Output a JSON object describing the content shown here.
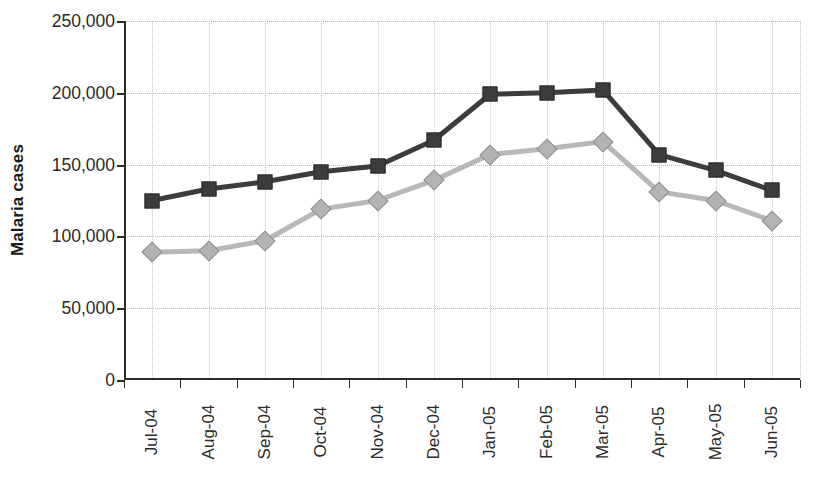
{
  "chart_data": {
    "type": "line",
    "title": "",
    "xlabel": "",
    "ylabel": "Malaria cases",
    "categories": [
      "Jul-04",
      "Aug-04",
      "Sep-04",
      "Oct-04",
      "Nov-04",
      "Dec-04",
      "Jan-05",
      "Feb-05",
      "Mar-05",
      "Apr-05",
      "May-05",
      "Jun-05"
    ],
    "ylim": [
      0,
      250000
    ],
    "yticks": [
      0,
      50000,
      100000,
      150000,
      200000,
      250000
    ],
    "ytick_labels": [
      "0",
      "50,000",
      "100,000",
      "150,000",
      "200,000",
      "250,000"
    ],
    "grid": true,
    "legend": "none",
    "series": [
      {
        "name": "series-dark-squares",
        "marker": "square",
        "color": "#3c3c3c",
        "line_color": "#3c3c3c",
        "values": [
          125000,
          133000,
          138000,
          145000,
          149000,
          167000,
          199000,
          200000,
          202000,
          157000,
          146000,
          132000
        ]
      },
      {
        "name": "series-light-diamonds",
        "marker": "diamond",
        "color": "#b3b3b3",
        "line_color": "#b8b8b8",
        "values": [
          89000,
          90000,
          97000,
          119000,
          125000,
          139000,
          157000,
          161000,
          166000,
          131000,
          125000,
          111000
        ]
      }
    ]
  },
  "axis": {
    "y_title": "Malaria cases"
  }
}
